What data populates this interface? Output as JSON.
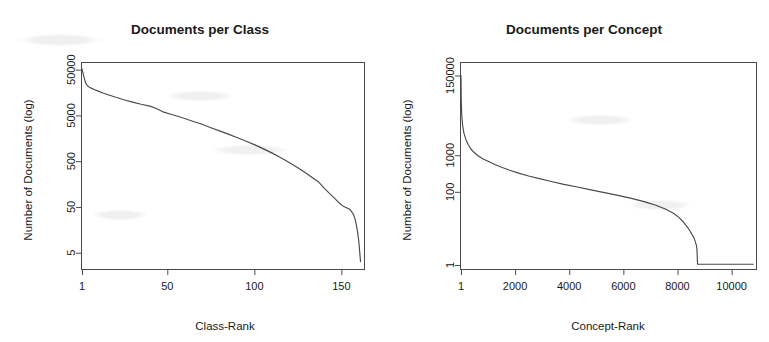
{
  "figure": {
    "background_color": "#ffffff",
    "ink_color": "#4a4a4a",
    "panel_count": 2
  },
  "chart_data": [
    {
      "type": "line",
      "title": "Documents per Class",
      "xlabel": "Class-Rank",
      "ylabel": "Number of Documents (log)",
      "xscale": "linear",
      "yscale": "log",
      "xlim": [
        1,
        163
      ],
      "ylim": [
        2.2,
        70000
      ],
      "grid": false,
      "legend": "none",
      "xticks": [
        1,
        50,
        100,
        150
      ],
      "xtick_labels": [
        "1",
        "50",
        "100",
        "150"
      ],
      "yticks": [
        5,
        50,
        500,
        5000,
        50000
      ],
      "ytick_labels": [
        "5",
        "50",
        "500",
        "5000",
        "50000"
      ],
      "series": [
        {
          "name": "documents-per-class",
          "x": [
            1,
            2,
            3,
            4,
            5,
            6,
            8,
            10,
            13,
            16,
            20,
            25,
            30,
            35,
            40,
            44,
            48,
            52,
            56,
            60,
            65,
            70,
            75,
            80,
            85,
            90,
            95,
            100,
            105,
            110,
            115,
            120,
            125,
            130,
            134,
            137,
            140,
            143,
            146,
            149,
            151,
            153,
            155,
            157,
            158,
            159,
            160,
            161
          ],
          "y": [
            52000,
            36000,
            26000,
            22500,
            21000,
            20000,
            18500,
            17200,
            15500,
            14200,
            12600,
            11000,
            9800,
            8800,
            8000,
            7000,
            5900,
            5300,
            4800,
            4300,
            3700,
            3200,
            2700,
            2300,
            1950,
            1650,
            1380,
            1150,
            940,
            760,
            600,
            470,
            360,
            270,
            210,
            175,
            130,
            100,
            78,
            60,
            52,
            48,
            44,
            34,
            26,
            17,
            9,
            3.2
          ]
        }
      ]
    },
    {
      "type": "line",
      "title": "Documents per Concept",
      "xlabel": "Concept-Rank",
      "ylabel": "Number of Documents (log)",
      "xscale": "linear",
      "yscale": "log",
      "xlim": [
        1,
        10900
      ],
      "ylim": [
        0.78,
        330000
      ],
      "grid": false,
      "legend": "none",
      "xticks": [
        1,
        2000,
        4000,
        6000,
        8000,
        10000
      ],
      "xtick_labels": [
        "1",
        "2000",
        "4000",
        "6000",
        "8000",
        "10000"
      ],
      "yticks": [
        1,
        100,
        1000,
        150000
      ],
      "ytick_labels": [
        "1",
        "100",
        "1000",
        "150000"
      ],
      "series": [
        {
          "name": "documents-per-concept",
          "x": [
            1,
            10,
            30,
            60,
            110,
            180,
            260,
            360,
            480,
            620,
            800,
            1000,
            1250,
            1500,
            1800,
            2100,
            2500,
            2900,
            3300,
            3800,
            4300,
            4800,
            5300,
            5800,
            6300,
            6800,
            7200,
            7550,
            7850,
            8050,
            8200,
            8320,
            8400,
            8460,
            8520,
            8570,
            8620,
            8660,
            8700,
            8720,
            8740,
            10800
          ],
          "y": [
            150000,
            30000,
            12000,
            6500,
            4000,
            2700,
            2000,
            1500,
            1200,
            980,
            800,
            680,
            560,
            470,
            390,
            330,
            270,
            230,
            195,
            160,
            135,
            113,
            95,
            80,
            66,
            53,
            43,
            34,
            26,
            20,
            15.5,
            12,
            10,
            8.5,
            7.2,
            6.2,
            5.2,
            4.3,
            3.4,
            2.6,
            1.05,
            1.05
          ]
        }
      ]
    }
  ]
}
